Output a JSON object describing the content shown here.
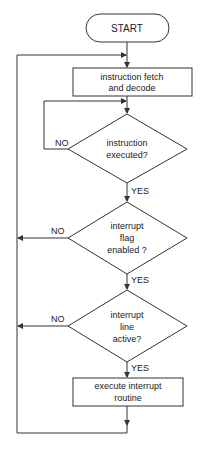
{
  "diagram": {
    "type": "flowchart",
    "stroke_color": "#333333",
    "nodes": {
      "start": {
        "label": "START"
      },
      "fetch": {
        "line1": "instruction fetch",
        "line2": "and decode"
      },
      "decision_executed": {
        "line1": "instruction",
        "line2": "executed?"
      },
      "decision_flag": {
        "line1": "interrupt",
        "line2": "flag",
        "line3": "enabled ?"
      },
      "decision_line": {
        "line1": "interrupt",
        "line2": "line",
        "line3": "active?"
      },
      "execute": {
        "line1": "execute interrupt",
        "line2": "routine"
      }
    },
    "edge_labels": {
      "executed_no": "NO",
      "executed_yes": "YES",
      "flag_no": "NO",
      "flag_yes": "YES",
      "line_no": "NO",
      "line_yes": "YES"
    }
  }
}
